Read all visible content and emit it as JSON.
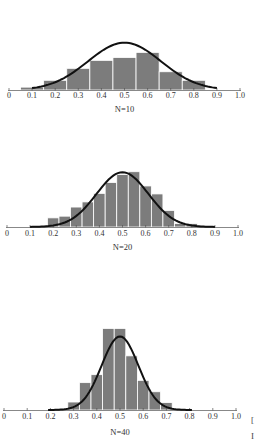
{
  "chart_data": [
    {
      "type": "bar",
      "title": "",
      "label": "N=10",
      "n": 10,
      "xlabel": "",
      "ylabel": "",
      "xlim": [
        0,
        1.0
      ],
      "xticks": [
        "0",
        "0.1",
        "0.2",
        "0.3",
        "0.4",
        "0.5",
        "0.6",
        "0.7",
        "0.8",
        "0.9",
        "1.0"
      ],
      "bin_width": 0.1,
      "bin_centers": [
        0.1,
        0.2,
        0.3,
        0.4,
        0.5,
        0.6,
        0.7,
        0.8
      ],
      "values": [
        5,
        17,
        38,
        52,
        57,
        66,
        32,
        17
      ],
      "curve": {
        "type": "normal",
        "mean": 0.5,
        "sd": 0.158,
        "peak": 83,
        "x_start": 0.1,
        "x_end": 0.9
      },
      "grid": false,
      "legend": null,
      "layout": {
        "x0": 9,
        "x1": 240,
        "baseline": 90,
        "ytick": 98,
        "nlabel_y": 112
      }
    },
    {
      "type": "bar",
      "title": "",
      "label": "N=20",
      "n": 20,
      "xlabel": "",
      "ylabel": "",
      "xlim": [
        0,
        1.0
      ],
      "xticks": [
        "0",
        "0.1",
        "0.2",
        "0.3",
        "0.4",
        "0.5",
        "0.6",
        "0.7",
        "0.8",
        "0.9",
        "1.0"
      ],
      "bin_width": 0.05,
      "bin_centers": [
        0.2,
        0.25,
        0.3,
        0.35,
        0.4,
        0.45,
        0.5,
        0.55,
        0.6,
        0.65,
        0.7,
        0.75,
        0.8
      ],
      "values": [
        16,
        19,
        35,
        44,
        59,
        78,
        92,
        97,
        72,
        58,
        29,
        6,
        6
      ],
      "curve": {
        "type": "normal",
        "mean": 0.5,
        "sd": 0.112,
        "peak": 96,
        "x_start": 0.1,
        "x_end": 0.9
      },
      "grid": false,
      "legend": null,
      "layout": {
        "x0": 7,
        "x1": 238,
        "baseline": 227,
        "ytick": 236,
        "nlabel_y": 250
      }
    },
    {
      "type": "bar",
      "title": "",
      "label": "N=40",
      "n": 40,
      "xlabel": "",
      "ylabel": "",
      "xlim": [
        0,
        1.0
      ],
      "xticks": [
        "0",
        "0.1",
        "0.2",
        "0.3",
        "0.4",
        "0.5",
        "0.6",
        "0.7",
        "0.8",
        "0.9",
        "1.0"
      ],
      "bin_width": 0.05,
      "bin_centers": [
        0.3,
        0.35,
        0.4,
        0.45,
        0.5,
        0.55,
        0.6,
        0.65,
        0.7
      ],
      "values": [
        14,
        48,
        62,
        143,
        143,
        95,
        52,
        32,
        13
      ],
      "curve": {
        "type": "normal",
        "mean": 0.5,
        "sd": 0.079,
        "peak": 129,
        "x_start": 0.19,
        "x_end": 0.81
      },
      "grid": false,
      "legend": null,
      "layout": {
        "x0": 4,
        "x1": 236,
        "baseline": 410,
        "ytick": 419,
        "nlabel_y": 435
      }
    }
  ],
  "edge_marks": [
    "[",
    "I"
  ]
}
